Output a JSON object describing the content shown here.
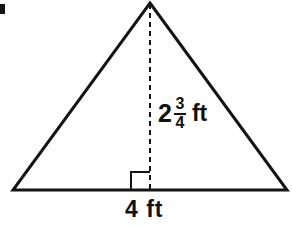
{
  "figure": {
    "kind": "geometry-diagram",
    "shape": "triangle",
    "background_color": "#ffffff",
    "stroke_color": "#141414",
    "text_color": "#111111",
    "outline": {
      "apex": {
        "x": 150,
        "y": 3
      },
      "left_vertex": {
        "x": 13,
        "y": 190
      },
      "right_vertex": {
        "x": 287,
        "y": 190
      },
      "stroke_width": 3
    },
    "altitude": {
      "style": "dashed",
      "from": {
        "x": 150,
        "y": 4
      },
      "to": {
        "x": 150,
        "y": 190
      },
      "dash_length": 5,
      "gap_length": 4,
      "stroke_width": 2
    },
    "right_angle_marker": {
      "x": 131,
      "y": 172,
      "size": 19,
      "stroke_width": 2
    },
    "corner_artifact": {
      "x": 0,
      "y": 4,
      "width": 5,
      "height": 10,
      "color": "#141414"
    }
  },
  "labels": {
    "height": {
      "whole": "2",
      "numerator": "3",
      "denominator": "4",
      "unit": "ft",
      "full_text": "2 3/4 ft"
    },
    "base": {
      "text": "4 ft"
    }
  }
}
